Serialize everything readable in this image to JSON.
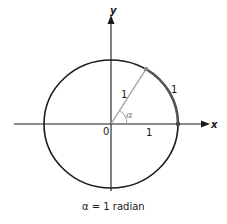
{
  "diagram": {
    "type": "unit-circle-radian",
    "axes": {
      "x_label": "x",
      "y_label": "y",
      "origin_label": "0"
    },
    "labels": {
      "radius_label": "1",
      "x_segment_label": "1",
      "arc_label": "1",
      "angle_label": "α"
    },
    "caption": "α = 1 radian",
    "colors": {
      "circle": "#1a1a1a",
      "axes": "#1a1a1a",
      "radius_line": "#9a9a9a",
      "arc_highlight": "#5a5a5a",
      "angle_arc": "#9a9a9a"
    }
  }
}
